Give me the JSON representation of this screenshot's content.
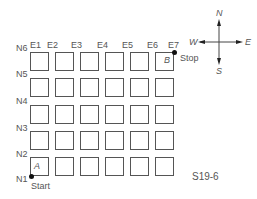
{
  "diagram": {
    "type": "city-grid-map",
    "figure_label": "S19-6",
    "columns": [
      "E1",
      "E2",
      "E3",
      "E4",
      "E5",
      "E6",
      "E7"
    ],
    "rows": [
      "N6",
      "N5",
      "N4",
      "N3",
      "N2",
      "N1"
    ],
    "blocks": {
      "cols": 6,
      "rows": 5
    },
    "start": {
      "point_label": "A",
      "text": "Start",
      "at": [
        "E1",
        "N1"
      ]
    },
    "stop": {
      "point_label": "B",
      "text": "Stop",
      "at": [
        "E7",
        "N6"
      ]
    },
    "compass": {
      "north": "N",
      "south": "S",
      "east": "E",
      "west": "W"
    }
  }
}
